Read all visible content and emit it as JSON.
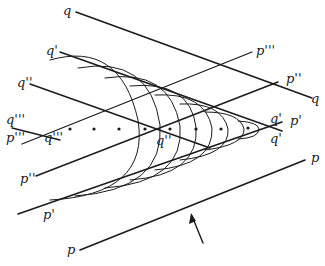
{
  "diagram": {
    "type": "wavefront construction (Mach cone / Huygens envelope)",
    "labels": {
      "q_top": "q",
      "q_top_right": "q",
      "q1_left": "q'",
      "q1_right_upper": "q'",
      "q1_right_lower": "q'",
      "q2_left": "q''",
      "q2_center": "q''",
      "q3_left": "q'''",
      "q3_center": "q'''",
      "p_bottom_left": "p",
      "p_bottom_right": "p",
      "p1_left": "p'",
      "p1_right": "p'",
      "p2_left": "p''",
      "p2_right": "p''",
      "p3_left": "p'''",
      "p3_right": "p'''"
    },
    "source_points_count": 8,
    "arrow": "direction of incidence (upward arrow below line p)",
    "colors": {
      "ink": "#1a1a1a",
      "background": "#ffffff"
    }
  }
}
